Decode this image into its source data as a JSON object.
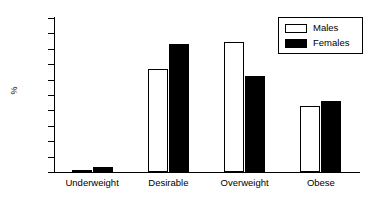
{
  "chart_data": {
    "type": "bar",
    "title": "",
    "subtitle": "",
    "xlabel": "",
    "ylabel": "%",
    "categories": [
      "Underweight",
      "Desirable",
      "Overweight",
      "Obese"
    ],
    "series": [
      {
        "name": "Males",
        "values": [
          0.8,
          33.5,
          42.3,
          21.3
        ],
        "color": "#ffffff",
        "edge_color": "#000000"
      },
      {
        "name": "Females",
        "values": [
          1.6,
          41.5,
          31.1,
          23.2
        ],
        "color": "#000000",
        "edge_color": "#000000"
      }
    ],
    "ylim": [
      0,
      50
    ],
    "ytick_labels": [
      "0",
      "5",
      "10",
      "15",
      "20",
      "25",
      "30",
      "35",
      "40",
      "45",
      "50"
    ],
    "ytick_values": [
      0,
      5,
      10,
      15,
      20,
      25,
      30,
      35,
      40,
      45,
      50
    ],
    "grid": false,
    "legend_position": "top-right",
    "legend_entries": [
      "Males",
      "Females"
    ]
  }
}
